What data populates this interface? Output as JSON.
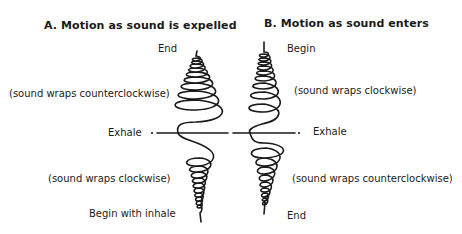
{
  "panel_a": {
    "title": "A. Motion as sound is expelled",
    "end_label": "End",
    "upper_note": "(sound wraps counterclockwise)",
    "midline_label": "Exhale",
    "lower_note": "(sound wraps clockwise)",
    "start_label": "Begin with inhale"
  },
  "panel_b": {
    "title": "B. Motion as sound enters",
    "start_label": "Begin",
    "upper_note": "(sound wraps clockwise)",
    "midline_label": "Exhale",
    "lower_note": "(sound wraps counterclockwise)",
    "end_label": "End"
  },
  "colors": {
    "ink": "#1a1a1a",
    "background": "#ffffff"
  }
}
